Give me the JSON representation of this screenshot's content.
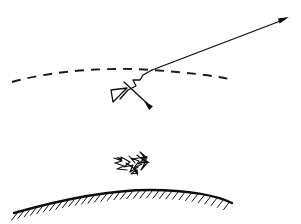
{
  "figure": {
    "title": "Ray scattering through a dashed boundary above a hatched curved surface",
    "canvas": {
      "width": 301,
      "height": 224,
      "background": "#ffffff"
    },
    "ink_color": "#0d0d0d"
  },
  "elements": {
    "dashed_boundary": {
      "name": "dashed-boundary-curve",
      "description": "Shallow arc drawn as a dashed line spanning the upper-middle of the figure",
      "style": "dashed",
      "dash_pattern": "9 7",
      "stroke_width": 1.9,
      "path": "M 12 82 C 55 70, 110 67, 152 70 C 196 73, 222 77, 233 80",
      "x_start": 12,
      "y_start": 82,
      "x_end": 233,
      "y_end": 80
    },
    "outgoing_ray": {
      "name": "outgoing-ray",
      "description": "Straight solid ray leaving the intersection point toward the upper right, terminated by an arrowhead",
      "style": "solid",
      "stroke_width": 1.3,
      "path": "M 152 70 L 283 20",
      "arrowhead_tip_x": 289,
      "arrowhead_tip_y": 17
    },
    "zigzag_path": {
      "name": "zigzag-scatter-path",
      "description": "Sharp zigzag descending from the boundary intersection down to the left",
      "style": "solid",
      "stroke_width": 1.3,
      "path": "M 152 70 L 143 75 L 140 80 L 133 80 L 136 86 L 128 90 L 120 99"
    },
    "loop_triangle": {
      "name": "loop-triangle-marker",
      "description": "Small narrow triangular loop on the left end of the zigzag",
      "style": "solid",
      "stroke_width": 1.3,
      "path": "M 127 88 L 111 90 L 113 102 Z"
    },
    "incoming_arrow": {
      "name": "incoming-ray-arrow",
      "description": "Solid line crossing the triangle and running down-right, ending in an arrowhead pointing down-left",
      "style": "solid",
      "stroke_width": 1.3,
      "path": "M 124 82 L 151 107",
      "arrowhead_tip_x": 144,
      "arrowhead_tip_y": 101
    },
    "scribble_cluster": {
      "name": "scribble-scatter-cluster",
      "description": "Dense jagged multi-segment scribble with small arrowheads, floating above the ground surface",
      "style": "solid",
      "stroke_width": 1.15,
      "center_x": 133,
      "center_y": 164,
      "paths": [
        "M 114 158 L 122 161 L 115 163 L 124 166 L 117 169 L 127 170",
        "M 121 157 L 130 162 L 124 167 L 133 165 L 130 172 L 138 167",
        "M 129 156 L 135 163 L 131 158 L 139 161 L 134 168 L 142 164",
        "M 137 155 L 143 160 L 138 164 L 146 161 L 141 170 L 148 162",
        "M 126 163 L 136 170 L 131 174 L 138 173",
        "M 133 159 L 144 157 L 140 152 L 147 158 L 143 163"
      ],
      "arrowheads": [
        {
          "tip_x": 116,
          "tip_y": 157,
          "angle": 205
        },
        {
          "tip_x": 148,
          "tip_y": 156,
          "angle": 330
        },
        {
          "tip_x": 138,
          "tip_y": 176,
          "angle": 70
        },
        {
          "tip_x": 150,
          "tip_y": 163,
          "angle": 20
        }
      ]
    },
    "ground_surface": {
      "name": "ground-surface-arc",
      "description": "Thick solid convex arc representing the curved ground or boundary surface",
      "style": "solid",
      "stroke_width": 2.4,
      "path": "M 14 213 C 60 200, 110 190, 150 190 C 190 190, 218 196, 232 203",
      "x_start": 14,
      "y_start": 213,
      "x_end": 232,
      "y_end": 203
    },
    "ground_hatching": {
      "name": "ground-hatching",
      "description": "Short parallel tick marks below the ground arc indicating solid material",
      "count": 34,
      "stroke_width": 1.0,
      "length": 9,
      "lean_degrees": 52
    }
  },
  "legend": {
    "items": [
      {
        "key": "dashed",
        "label": "dashed boundary"
      },
      {
        "key": "solid-ray",
        "label": "ray path"
      },
      {
        "key": "hatched",
        "label": "ground surface"
      }
    ]
  }
}
